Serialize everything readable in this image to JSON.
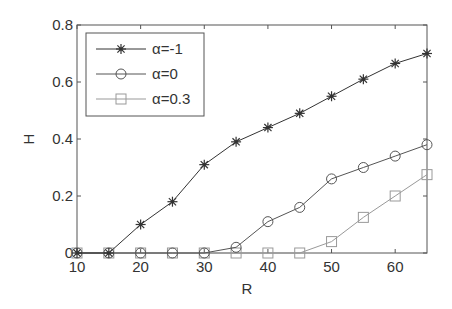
{
  "chart_data": {
    "type": "line",
    "title": "",
    "xlabel": "R",
    "ylabel": "H",
    "xlim": [
      10,
      65
    ],
    "ylim": [
      0,
      0.8
    ],
    "xticks": [
      10,
      20,
      30,
      40,
      50,
      60
    ],
    "xtick_labels": [
      "10",
      "20",
      "30",
      "40",
      "50",
      "60"
    ],
    "yticks": [
      0,
      0.2,
      0.4,
      0.6,
      0.8
    ],
    "ytick_labels": [
      "0",
      "0.2",
      "0.4",
      "0.6",
      "0.8"
    ],
    "grid": false,
    "legend_position": "upper left",
    "x": [
      10,
      15,
      20,
      25,
      30,
      35,
      40,
      45,
      50,
      55,
      60,
      65
    ],
    "series": [
      {
        "name": "α=-1",
        "marker": "asterisk",
        "color": "#333333",
        "values": [
          0,
          0,
          0.1,
          0.18,
          0.31,
          0.39,
          0.44,
          0.49,
          0.55,
          0.61,
          0.665,
          0.7
        ]
      },
      {
        "name": "α=0",
        "marker": "circle",
        "color": "#555555",
        "values": [
          0,
          0,
          0,
          0,
          0,
          0.02,
          0.11,
          0.16,
          0.26,
          0.3,
          0.34,
          0.38
        ]
      },
      {
        "name": "α=0.3",
        "marker": "square",
        "color": "#999999",
        "values": [
          0,
          0,
          0,
          0,
          0,
          0,
          0,
          0,
          0.04,
          0.125,
          0.2,
          0.275
        ]
      }
    ]
  }
}
